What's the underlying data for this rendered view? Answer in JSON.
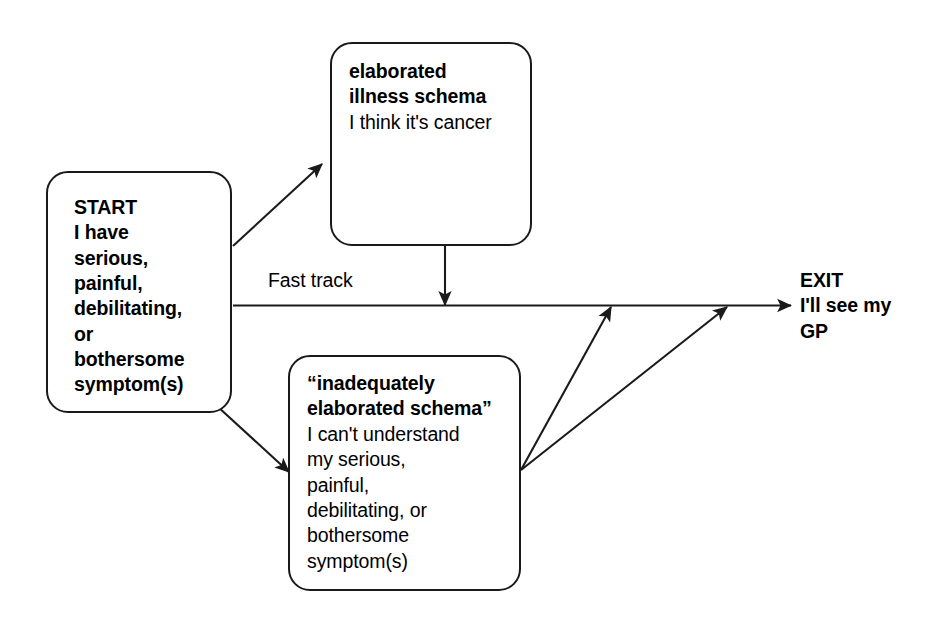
{
  "diagram": {
    "background_color": "#ffffff",
    "line_color": "#1a1a1a",
    "nodes": {
      "start": {
        "name": "START",
        "heading": "START",
        "body": "I have\nserious,\npainful,\ndebilitating,\nor\nbothersome\nsymptom(s)",
        "full_text": "START\nI have\nserious,\npainful,\ndebilitating,\nor\nbothersome\nsymptom(s)",
        "emphasis": "bold"
      },
      "elaborated": {
        "heading": "elaborated\nillness schema",
        "body": "I think it's cancer",
        "heading_emphasis": "bold",
        "body_emphasis": "regular"
      },
      "inadequate": {
        "heading": "“inadequately\nelaborated schema”",
        "body": "I can't understand\nmy serious,\npainful,\ndebilitating, or\nbothersome\nsymptom(s)",
        "heading_emphasis": "bold",
        "body_emphasis": "regular"
      }
    },
    "labels": {
      "fast_track": "Fast track",
      "exit": "EXIT\nI'll see my\nGP",
      "exit_emphasis": "bold"
    },
    "edges": [
      {
        "id": "start-to-elaborated",
        "from": "start",
        "to": "elaborated",
        "label": "",
        "style": "solid-arrow"
      },
      {
        "id": "start-to-exit-fast-track",
        "from": "start",
        "to": "exit",
        "label": "Fast track",
        "style": "solid-arrow"
      },
      {
        "id": "start-to-inadequate",
        "from": "start",
        "to": "inadequate",
        "label": "",
        "style": "solid-arrow"
      },
      {
        "id": "elaborated-to-fast-track-line",
        "from": "elaborated",
        "to": "start-to-exit-fast-track",
        "label": "",
        "style": "solid-arrow"
      },
      {
        "id": "inadequate-to-exit-a",
        "from": "inadequate",
        "to": "exit",
        "label": "",
        "style": "solid-arrow"
      },
      {
        "id": "inadequate-to-exit-b",
        "from": "inadequate",
        "to": "exit",
        "label": "",
        "style": "solid-arrow"
      }
    ]
  }
}
